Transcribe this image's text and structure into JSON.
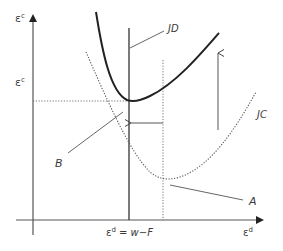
{
  "diagram": {
    "axes": {
      "y_label": "ε",
      "y_label_sup": "c",
      "y_tick_label": "ε",
      "y_tick_label_sup": "c",
      "x_label": "ε",
      "x_label_sup": "d",
      "x_tick_label_base": "ε",
      "x_tick_label_sup": "d",
      "x_tick_label_rest": " = w−F"
    },
    "curves": [
      {
        "name": "JD",
        "label": "JD",
        "style": "solid"
      },
      {
        "name": "JC",
        "label": "JC",
        "style": "dotted"
      }
    ],
    "points": [
      {
        "label": "A",
        "description": "minimum of JC curve"
      },
      {
        "label": "B",
        "description": "minimum of JD curve at constraint"
      }
    ],
    "arrows": [
      {
        "direction": "left",
        "description": "shift from unconstrained to constrained ε^d"
      },
      {
        "direction": "up",
        "description": "shift of JC up to JD"
      }
    ],
    "colors": {
      "line": "#333333",
      "thin_line": "#555555",
      "dotted": "#666666",
      "text": "#3a3a3a"
    }
  }
}
